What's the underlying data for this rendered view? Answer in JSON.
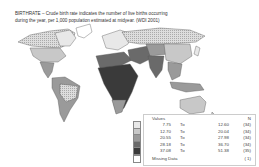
{
  "caption": {
    "line1": "BIRTHRATE – Crude birth rate indicates the number of live births occurring",
    "line2": "during the year, per 1,000 population estimated at midyear. (WDI 2001)"
  },
  "legend": {
    "values_header": "Values",
    "n_header": "N",
    "to_label": "To",
    "classes": [
      {
        "low": "7.75",
        "high": "12.60",
        "n": "(34)",
        "color": "#e8e8e8"
      },
      {
        "low": "12.70",
        "high": "20.04",
        "n": "(34)",
        "color": "#c8c8c8"
      },
      {
        "low": "20.55",
        "high": "27.98",
        "n": "(34)",
        "color": "#9a9a9a"
      },
      {
        "low": "28.18",
        "high": "36.70",
        "n": "(34)",
        "color": "#6a6a6a"
      },
      {
        "low": "37.08",
        "high": "51.38",
        "n": "(35)",
        "color": "#3a3a3a"
      }
    ],
    "missing_label": "Missing Data",
    "missing_n": "( 1)"
  }
}
